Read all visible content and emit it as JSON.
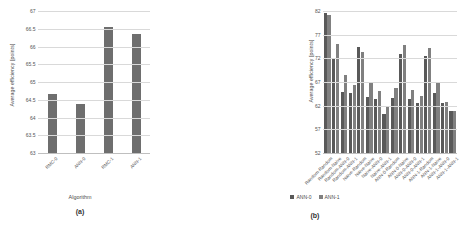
{
  "chart_data": [
    {
      "type": "bar",
      "panel": "(a)",
      "title": "",
      "xlabel": "Algorithm",
      "ylabel": "Average efficiency [points]",
      "ylim": [
        63,
        67
      ],
      "yticks": [
        63,
        63.5,
        64,
        64.5,
        65,
        65.5,
        66,
        66.5,
        67
      ],
      "ytick_labels": [
        "63",
        "63.5",
        "64",
        "64.5",
        "65",
        "65.5",
        "66",
        "66.5",
        "67"
      ],
      "grid": true,
      "legend": "none",
      "categories": [
        "RMC-0",
        "ANN-0",
        "RMC-1",
        "ANN-1"
      ],
      "values": [
        64.68,
        64.42,
        66.58,
        66.38
      ],
      "bar_color": "#6e6e6e"
    },
    {
      "type": "bar",
      "panel": "(b)",
      "title": "",
      "xlabel": "",
      "ylabel": "Average efficiency [points]",
      "ylim": [
        52,
        82
      ],
      "yticks": [
        52,
        57,
        62,
        67,
        72,
        77,
        82
      ],
      "ytick_labels": [
        "52",
        "57",
        "62",
        "67",
        "72",
        "77",
        "82"
      ],
      "grid": true,
      "legend": "bottom",
      "categories": [
        "Random-Random",
        "Random-Naive",
        "Random-ANN-0",
        "Random-ANN-1",
        "Naive-Random",
        "Naive-Naive",
        "Naive-ANN-0",
        "Naive-ANN-1",
        "ANN-0-Random",
        "ANN-0-Naive",
        "ANN-0-ANN-0",
        "ANN-0-ANN-1",
        "ANN-1-Random",
        "ANN-1-Naive",
        "ANN-1-ANN-0",
        "ANN-1-ANN-1"
      ],
      "series": [
        {
          "name": "ANN-0",
          "color": "#595959",
          "values": [
            81.7,
            81.5,
            72.1,
            75.2,
            65.1,
            68.6,
            65.8,
            66.6,
            74.5,
            73.6,
            64.0,
            67.3,
            63.7,
            65.4,
            60.5,
            62.0
          ]
        },
        {
          "name": "ANN-1",
          "color": "#808080",
          "values": [
            81.7,
            81.5,
            72.1,
            75.2,
            65.1,
            68.6,
            65.8,
            66.6,
            74.5,
            73.6,
            64.0,
            67.3,
            63.7,
            65.4,
            60.5,
            62.0
          ]
        }
      ],
      "pairs": [
        {
          "category": "Random-Random",
          "ANN-0": 81.7,
          "ANN-1": 81.3
        },
        {
          "category": "Random-Naive",
          "ANN-0": 72.1,
          "ANN-1": 75.2
        },
        {
          "category": "Random-ANN-0",
          "ANN-0": 65.1,
          "ANN-1": 68.6
        },
        {
          "category": "Random-ANN-1",
          "ANN-0": 64.8,
          "ANN-1": 66.6
        },
        {
          "category": "Naive-Random",
          "ANN-0": 74.6,
          "ANN-1": 73.6
        },
        {
          "category": "Naive-Naive",
          "ANN-0": 64.0,
          "ANN-1": 67.3
        },
        {
          "category": "Naive-ANN-0",
          "ANN-0": 63.7,
          "ANN-1": 65.4
        },
        {
          "category": "Naive-ANN-1",
          "ANN-0": 60.5,
          "ANN-1": 62.0
        },
        {
          "category": "ANN-0-Random",
          "ANN-0": 63.8,
          "ANN-1": 66.0
        },
        {
          "category": "ANN-0-Naive",
          "ANN-0": 73.1,
          "ANN-1": 75.0
        },
        {
          "category": "ANN-0-ANN-0",
          "ANN-0": 63.6,
          "ANN-1": 65.6
        },
        {
          "category": "ANN-0-ANN-1",
          "ANN-0": 62.7,
          "ANN-1": 64.3
        },
        {
          "category": "ANN-1-Random",
          "ANN-0": 72.8,
          "ANN-1": 74.5
        },
        {
          "category": "ANN-1-Naive",
          "ANN-0": 64.9,
          "ANN-1": 66.9
        },
        {
          "category": "ANN-1-ANN-0",
          "ANN-0": 62.8,
          "ANN-1": 63.0
        },
        {
          "category": "ANN-1-ANN-1",
          "ANN-0": 61.0,
          "ANN-1": 61.0
        }
      ],
      "legend_entries": [
        {
          "label": "ANN-0",
          "color": "#595959"
        },
        {
          "label": "ANN-1",
          "color": "#808080"
        }
      ]
    }
  ],
  "panel_a": {
    "caption": "(a)",
    "xaxis_title": "Algorithm",
    "yaxis_title": "Average efficiency [points]"
  },
  "panel_b": {
    "caption": "(b)",
    "yaxis_title": "Average efficiency [points]"
  }
}
